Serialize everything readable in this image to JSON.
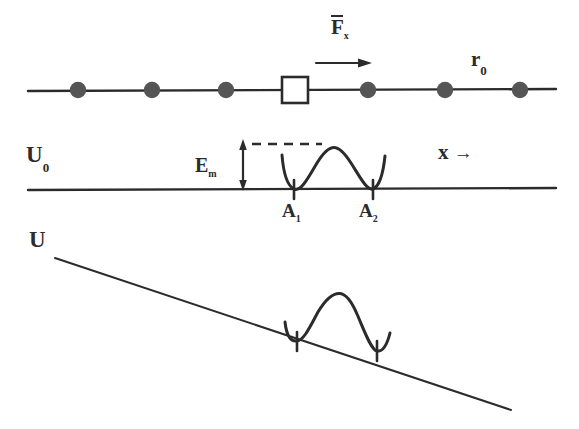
{
  "figure": {
    "title_semantic": "potential-barrier-diagram",
    "ink_color": "#2b2b2b",
    "background": "#ffffff",
    "panels": [
      {
        "id": "atom-chain",
        "description": "linear chain of atoms with interstitial defect under applied force"
      },
      {
        "id": "flat-potential",
        "description": "unperturbed potential U0 with double-well barrier"
      },
      {
        "id": "tilted-potential",
        "description": "potential U tilted by applied force with double-well barrier"
      }
    ]
  },
  "labels": {
    "force": {
      "symbol": "F",
      "subscript": "x",
      "has_overbar": true,
      "full": "F̅ₓ"
    },
    "lattice_spacing": {
      "symbol": "r",
      "subscript": "0",
      "full": "r₀"
    },
    "potential_flat": {
      "symbol": "U",
      "subscript": "0",
      "full": "U₀"
    },
    "migration_energy": {
      "symbol": "E",
      "subscript": "m",
      "full": "Eₘ"
    },
    "axis_x": {
      "symbol": "x",
      "arrow": "→",
      "full": "x →"
    },
    "site_a1": {
      "symbol": "A",
      "subscript": "1",
      "full": "A₁"
    },
    "site_a2": {
      "symbol": "A",
      "subscript": "2",
      "full": "A₂"
    },
    "potential_tilted": {
      "symbol": "U",
      "full": "U"
    }
  },
  "chain": {
    "baseline_y": 90,
    "line_start_x": 28,
    "line_end_x": 556,
    "atom_radius": 8,
    "atom_positions_x": [
      78,
      152,
      226,
      368,
      445,
      520
    ],
    "defect": {
      "shape": "square",
      "center_x": 295,
      "center_y": 90,
      "size": 26
    },
    "force_arrow": {
      "start_x": 316,
      "end_x": 370,
      "y": 63
    }
  },
  "flat_panel": {
    "baseline_y": 189,
    "line_start_x": 28,
    "line_end_x": 556,
    "dashed_line": {
      "y": 144,
      "start_x": 250,
      "end_x": 320
    },
    "energy_arrow": {
      "x": 243,
      "top_y": 143,
      "bottom_y": 189
    },
    "well_a1_x": 294,
    "well_a2_x": 373,
    "barrier_peak_x": 334,
    "barrier_peak_y": 150
  },
  "tilted_panel": {
    "line_start": {
      "x": 55,
      "y": 258
    },
    "line_end": {
      "x": 511,
      "y": 410
    },
    "well_a1_x": 297,
    "well_a2_x": 377,
    "barrier_peak_x": 340,
    "barrier_peak_y": 301
  },
  "label_positions": {
    "force": {
      "x": 335,
      "y": 20
    },
    "lattice_spacing": {
      "x": 473,
      "y": 52
    },
    "potential_flat": {
      "x": 28,
      "y": 146
    },
    "migration_energy": {
      "x": 196,
      "y": 157
    },
    "axis_x": {
      "x": 440,
      "y": 145
    },
    "site_a1": {
      "x": 283,
      "y": 203
    },
    "site_a2": {
      "x": 360,
      "y": 203
    },
    "potential_tilted": {
      "x": 30,
      "y": 230
    }
  }
}
